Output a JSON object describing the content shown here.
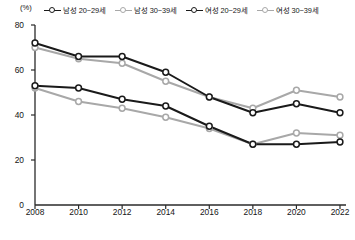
{
  "unit": "(%)",
  "legend": {
    "items": [
      {
        "label": "남성 20~29세",
        "color": "#1a1a1a",
        "marker_icon": "open-circle-marker-icon"
      },
      {
        "label": "남성 30~39세",
        "color": "#a8a8a8",
        "marker_icon": "open-circle-marker-icon"
      },
      {
        "label": "여성 20~29세",
        "color": "#1a1a1a",
        "marker_icon": "open-circle-marker-icon"
      },
      {
        "label": "여성 30~39세",
        "color": "#a8a8a8",
        "marker_icon": "open-circle-marker-icon"
      }
    ]
  },
  "chart_data": {
    "type": "line",
    "title": "",
    "subtitle": "",
    "xlabel": "",
    "ylabel": "(%)",
    "categories": [
      "2008",
      "2010",
      "2012",
      "2014",
      "2016",
      "2018",
      "2020",
      "2022"
    ],
    "x": [
      2008,
      2010,
      2012,
      2014,
      2016,
      2018,
      2020,
      2022
    ],
    "xlim": [
      2008,
      2022
    ],
    "ylim": [
      0,
      80
    ],
    "yticks": [
      0,
      20,
      40,
      60,
      80
    ],
    "ytick_labels": [
      "0",
      "20",
      "40",
      "60",
      "80"
    ],
    "grid": false,
    "legend_position": "top",
    "series": [
      {
        "name": "남성 20~29세",
        "color": "#1a1a1a",
        "values": [
          72,
          66,
          66,
          59,
          48,
          41,
          45,
          41
        ]
      },
      {
        "name": "남성 30~39세",
        "color": "#a8a8a8",
        "values": [
          70,
          65,
          63,
          55,
          48,
          43,
          51,
          48
        ]
      },
      {
        "name": "여성 20~29세",
        "color": "#1a1a1a",
        "values": [
          53,
          52,
          47,
          44,
          35,
          27,
          27,
          28
        ]
      },
      {
        "name": "여성 30~39세",
        "color": "#a8a8a8",
        "values": [
          52,
          46,
          43,
          39,
          34,
          27,
          32,
          31
        ]
      }
    ]
  }
}
